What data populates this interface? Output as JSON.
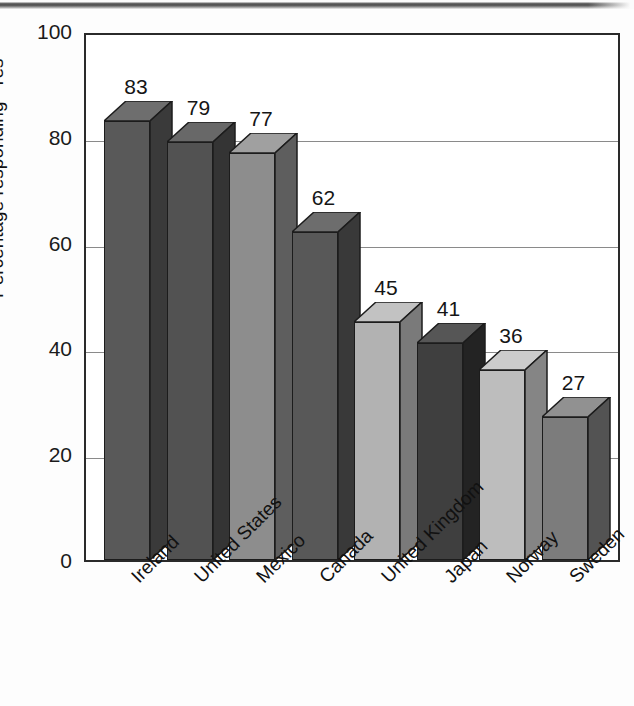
{
  "chart_data": {
    "type": "bar",
    "title": "",
    "subtitle": "",
    "xlabel": "",
    "ylabel": "Percentage responding \"Yes\"",
    "ylim": [
      0,
      100
    ],
    "yticks": [
      0,
      20,
      40,
      60,
      80,
      100
    ],
    "ytick_labels": [
      "0",
      "20",
      "40",
      "60",
      "80",
      "100"
    ],
    "grid": true,
    "grid_axis": "y",
    "legend": false,
    "legend_position": "none",
    "style": "3d-bars-grayscale",
    "categories": [
      "Ireland",
      "United States",
      "Mexico",
      "Canada",
      "United Kingdom",
      "Japan",
      "Norway",
      "Sweden"
    ],
    "values": [
      83,
      79,
      77,
      62,
      45,
      41,
      36,
      27
    ],
    "value_labels": [
      "83",
      "79",
      "77",
      "62",
      "45",
      "41",
      "36",
      "27"
    ],
    "bar_colors": [
      "#595959",
      "#525252",
      "#8d8d8d",
      "#585858",
      "#b2b2b2",
      "#3f3f3f",
      "#bdbdbd",
      "#7c7c7c"
    ],
    "bar_top_colors": [
      "#6e6e6e",
      "#686868",
      "#a0a0a0",
      "#6d6d6d",
      "#c2c2c2",
      "#565656",
      "#cccccc",
      "#919191"
    ],
    "bar_side_colors": [
      "#3a3a3a",
      "#343434",
      "#5e5e5e",
      "#393939",
      "#7a7a7a",
      "#232323",
      "#858585",
      "#535353"
    ],
    "axis_color": "#2a2a2a",
    "gridline_color": "#8a8a8a",
    "background_color": "#ffffff"
  }
}
